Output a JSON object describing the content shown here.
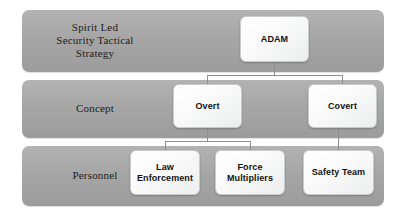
{
  "diagram": {
    "colors": {
      "band_fill": "#a6a6a6",
      "box_fill": "#fbfbfb",
      "box_border": "#c9ccce",
      "connector": "#8d9093",
      "text": "#111111",
      "background": "#ffffff"
    },
    "tiers": [
      {
        "id": "strategy",
        "label": "Spirit Led\nSecurity Tactical\nStrategy"
      },
      {
        "id": "concept",
        "label": "Concept"
      },
      {
        "id": "personnel",
        "label": "Personnel"
      }
    ],
    "nodes": [
      {
        "id": "adam",
        "label": "ADAM",
        "tier": "strategy"
      },
      {
        "id": "overt",
        "label": "Overt",
        "tier": "concept"
      },
      {
        "id": "covert",
        "label": "Covert",
        "tier": "concept"
      },
      {
        "id": "law-enforcement",
        "label": "Law\nEnforcement",
        "tier": "personnel"
      },
      {
        "id": "force-multipliers",
        "label": "Force\nMultipliers",
        "tier": "personnel"
      },
      {
        "id": "safety-team",
        "label": "Safety Team",
        "tier": "personnel"
      }
    ],
    "edges": [
      {
        "from": "adam",
        "to": "overt"
      },
      {
        "from": "adam",
        "to": "covert"
      },
      {
        "from": "overt",
        "to": "law-enforcement"
      },
      {
        "from": "overt",
        "to": "force-multipliers"
      },
      {
        "from": "covert",
        "to": "safety-team"
      }
    ]
  }
}
